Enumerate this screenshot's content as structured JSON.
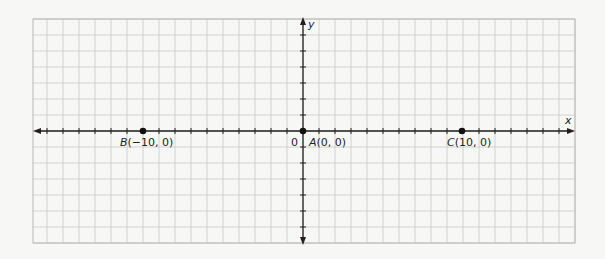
{
  "chart_data": {
    "type": "scatter",
    "title": "",
    "xlabel": "x",
    "ylabel": "y",
    "xlim": [
      -16.9,
      16.9
    ],
    "ylim": [
      -7,
      7
    ],
    "grid": true,
    "legend": null,
    "origin_label": "0",
    "points": [
      {
        "name": "A",
        "x": 0,
        "y": 0,
        "label": "A(0, 0)"
      },
      {
        "name": "B",
        "x": -10,
        "y": 0,
        "label": "B(−10, 0)"
      },
      {
        "name": "C",
        "x": 10,
        "y": 0,
        "label": "C(10, 0)"
      }
    ]
  },
  "labels": {
    "x_axis": "x",
    "y_axis": "y",
    "origin": "0",
    "point_a_letter": "A",
    "point_a_coords": "(0, 0)",
    "point_b_letter": "B",
    "point_b_coords": "(−10, 0)",
    "point_c_letter": "C",
    "point_c_coords": "(10, 0)"
  },
  "colors": {
    "grid": "#c9c9c9",
    "axis": "#231f20",
    "point": "#111111",
    "background": "#ffffff"
  }
}
